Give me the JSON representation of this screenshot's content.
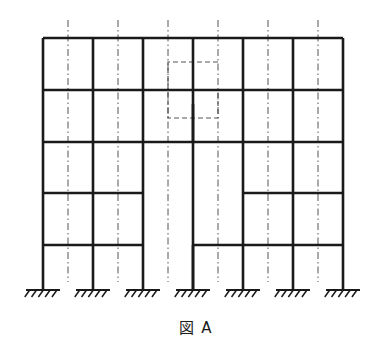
{
  "figure": {
    "caption": "図 A",
    "caption_label": "図",
    "caption_id": "A",
    "type": "structural-frame-elevation"
  },
  "colors": {
    "member": "#1a1a1a",
    "centerline": "#555555",
    "hidden_outline": "#555555",
    "background": "#ffffff",
    "caption_text": "#1a1a1a"
  },
  "geometry": {
    "canvas_width": 392,
    "canvas_height": 353,
    "member_stroke_width": 2.6,
    "centerline_stroke_width": 1.0,
    "hidden_stroke_width": 1.2,
    "centerline_dash": "7 3 1.5 3",
    "hidden_dash": "5 3"
  },
  "structure": {
    "bays": 6,
    "stories": 5,
    "column_count": 7,
    "support_count": 7,
    "column_x": [
      43,
      93,
      143,
      193,
      243,
      293,
      343
    ],
    "centerline_x": [
      68,
      118,
      168,
      218,
      268,
      318
    ],
    "floor_y": [
      38,
      90,
      142,
      193,
      245
    ],
    "base_y": 290,
    "roof_y": 38,
    "centerline_top_y": 20,
    "centerline_bottom_y": 282
  },
  "columns": [
    {
      "name": "column-1",
      "x": 43,
      "y_top": 38,
      "y_bottom": 290
    },
    {
      "name": "column-2",
      "x": 93,
      "y_top": 38,
      "y_bottom": 290
    },
    {
      "name": "column-3",
      "x": 143,
      "y_top": 38,
      "y_bottom": 290
    },
    {
      "name": "column-4",
      "x": 193,
      "y_top": 38,
      "y_bottom": 290
    },
    {
      "name": "column-5",
      "x": 243,
      "y_top": 38,
      "y_bottom": 290
    },
    {
      "name": "column-6",
      "x": 293,
      "y_top": 38,
      "y_bottom": 290
    },
    {
      "name": "column-7",
      "x": 343,
      "y_top": 38,
      "y_bottom": 290
    }
  ],
  "column_stubs": [
    {
      "name": "column-stub-4-upper",
      "x": 193,
      "y_top": 104,
      "y_bottom": 142
    },
    {
      "name": "column-stub-4-lower",
      "x": 193,
      "y_top": 245,
      "y_bottom": 290
    }
  ],
  "beams": [
    {
      "name": "beam-roof-bay-1",
      "story": "roof",
      "y": 38,
      "x1": 43,
      "x2": 93
    },
    {
      "name": "beam-roof-bay-2",
      "story": "roof",
      "y": 38,
      "x1": 93,
      "x2": 143
    },
    {
      "name": "beam-roof-bay-3",
      "story": "roof",
      "y": 38,
      "x1": 143,
      "x2": 193
    },
    {
      "name": "beam-roof-bay-4",
      "story": "roof",
      "y": 38,
      "x1": 193,
      "x2": 243
    },
    {
      "name": "beam-roof-bay-5",
      "story": "roof",
      "y": 38,
      "x1": 243,
      "x2": 293
    },
    {
      "name": "beam-roof-bay-6",
      "story": "roof",
      "y": 38,
      "x1": 293,
      "x2": 343
    },
    {
      "name": "beam-l4-bay-1",
      "story": "4",
      "y": 90,
      "x1": 43,
      "x2": 93
    },
    {
      "name": "beam-l4-bay-2",
      "story": "4",
      "y": 90,
      "x1": 93,
      "x2": 143
    },
    {
      "name": "beam-l4-bay-3",
      "story": "4",
      "y": 90,
      "x1": 143,
      "x2": 193
    },
    {
      "name": "beam-l4-bay-4",
      "story": "4",
      "y": 90,
      "x1": 193,
      "x2": 243
    },
    {
      "name": "beam-l4-bay-5",
      "story": "4",
      "y": 90,
      "x1": 243,
      "x2": 293
    },
    {
      "name": "beam-l4-bay-6",
      "story": "4",
      "y": 90,
      "x1": 293,
      "x2": 343
    },
    {
      "name": "beam-l3-bay-1",
      "story": "3",
      "y": 142,
      "x1": 43,
      "x2": 93
    },
    {
      "name": "beam-l3-bay-2",
      "story": "3",
      "y": 142,
      "x1": 93,
      "x2": 143
    },
    {
      "name": "beam-l3-bay-3",
      "story": "3",
      "y": 142,
      "x1": 143,
      "x2": 193
    },
    {
      "name": "beam-l3-bay-4",
      "story": "3",
      "y": 142,
      "x1": 193,
      "x2": 243
    },
    {
      "name": "beam-l3-bay-5",
      "story": "3",
      "y": 142,
      "x1": 243,
      "x2": 293
    },
    {
      "name": "beam-l3-bay-6",
      "story": "3",
      "y": 142,
      "x1": 293,
      "x2": 343
    },
    {
      "name": "beam-l2-bay-1",
      "story": "2",
      "y": 193,
      "x1": 43,
      "x2": 93
    },
    {
      "name": "beam-l2-bay-2",
      "story": "2",
      "y": 193,
      "x1": 93,
      "x2": 143
    },
    {
      "name": "beam-l2-bay-5",
      "story": "2",
      "y": 193,
      "x1": 243,
      "x2": 293
    },
    {
      "name": "beam-l2-bay-6",
      "story": "2",
      "y": 193,
      "x1": 293,
      "x2": 343
    },
    {
      "name": "beam-l1-bay-1",
      "story": "1",
      "y": 245,
      "x1": 43,
      "x2": 93
    },
    {
      "name": "beam-l1-bay-2",
      "story": "1",
      "y": 245,
      "x1": 93,
      "x2": 143
    },
    {
      "name": "beam-l1-bay-4",
      "story": "1",
      "y": 245,
      "x1": 193,
      "x2": 243
    },
    {
      "name": "beam-l1-bay-5",
      "story": "1",
      "y": 245,
      "x1": 243,
      "x2": 293
    },
    {
      "name": "beam-l1-bay-6",
      "story": "1",
      "y": 245,
      "x1": 293,
      "x2": 343
    }
  ],
  "atrium_void": {
    "name": "atrium-void",
    "x1": 143,
    "x2": 243,
    "y1": 142,
    "y2": 245,
    "note": "open bay with no intermediate beams"
  },
  "centerlines": [
    {
      "name": "centerline-1",
      "x": 68,
      "y1": 20,
      "y2": 282
    },
    {
      "name": "centerline-2",
      "x": 118,
      "y1": 20,
      "y2": 282
    },
    {
      "name": "centerline-3",
      "x": 168,
      "y1": 20,
      "y2": 282
    },
    {
      "name": "centerline-4",
      "x": 218,
      "y1": 20,
      "y2": 282
    },
    {
      "name": "centerline-5",
      "x": 268,
      "y1": 20,
      "y2": 282
    },
    {
      "name": "centerline-6",
      "x": 318,
      "y1": 20,
      "y2": 282
    }
  ],
  "centerline_short": {
    "name": "centerline-atrium-stub",
    "x": 193,
    "y1": 210,
    "y2": 245
  },
  "hidden_outline": {
    "name": "hidden-stepped-outline",
    "points": "218,62 168,62 168,118 218,118 218,90 193,90 193,62",
    "note": "dashed stepped (Z-shaped) hidden region in upper middle bays"
  },
  "supports": [
    {
      "name": "support-1",
      "x": 43,
      "y": 290,
      "label": "fixed"
    },
    {
      "name": "support-2",
      "x": 93,
      "y": 290,
      "label": "fixed"
    },
    {
      "name": "support-3",
      "x": 143,
      "y": 290,
      "label": "fixed"
    },
    {
      "name": "support-4",
      "x": 193,
      "y": 290,
      "label": "fixed"
    },
    {
      "name": "support-5",
      "x": 243,
      "y": 290,
      "label": "fixed"
    },
    {
      "name": "support-6",
      "x": 293,
      "y": 290,
      "label": "fixed"
    },
    {
      "name": "support-7",
      "x": 343,
      "y": 290,
      "label": "fixed"
    }
  ],
  "support_style": {
    "half_width": 17,
    "hatch_count": 5,
    "hatch_length": 7,
    "hatch_slant": 5
  }
}
